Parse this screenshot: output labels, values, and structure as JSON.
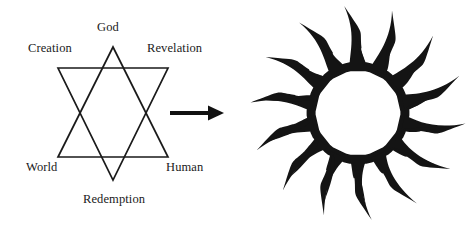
{
  "figure": {
    "background_color": "#ffffff",
    "ink_color": "#1a1a1a",
    "width": 474,
    "height": 227
  },
  "hexagram": {
    "name": "star-of-david",
    "stroke_color": "#1a1a1a",
    "stroke_width": 1.6,
    "labels": [
      {
        "id": "god",
        "text": "God",
        "position": "top"
      },
      {
        "id": "creation",
        "text": "Creation",
        "position": "upper-left"
      },
      {
        "id": "revelation",
        "text": "Revelation",
        "position": "upper-right"
      },
      {
        "id": "world",
        "text": "World",
        "position": "lower-left"
      },
      {
        "id": "human",
        "text": "Human",
        "position": "lower-right"
      },
      {
        "id": "redemption",
        "text": "Redemption",
        "position": "bottom"
      }
    ],
    "upward_triangle_points": "113,47 168,157 58,157",
    "downward_triangle_points": "58,68 168,68 113,180"
  },
  "arrow": {
    "name": "right-arrow",
    "color": "#111111",
    "from_x": 170,
    "to_x": 223,
    "y": 113
  },
  "sunburst": {
    "name": "sunburst-flame-star",
    "color": "#141414",
    "ray_count": 14,
    "center_x": 358,
    "center_y": 113,
    "inner_radius": 46,
    "outer_radius": 108
  }
}
